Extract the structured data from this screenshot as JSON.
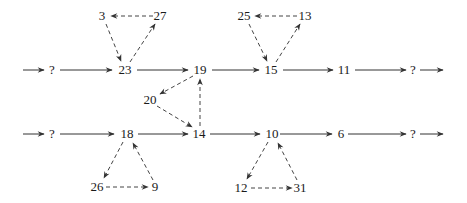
{
  "diagram": {
    "type": "directed-graph",
    "nodes": [
      {
        "id": "q1",
        "label": "?",
        "x": 78,
        "y": 70
      },
      {
        "id": "n23",
        "label": "23",
        "x": 125,
        "y": 70
      },
      {
        "id": "n19",
        "label": "19",
        "x": 200,
        "y": 70
      },
      {
        "id": "n15",
        "label": "15",
        "x": 271,
        "y": 70
      },
      {
        "id": "n11",
        "label": "11",
        "x": 344,
        "y": 70
      },
      {
        "id": "q2",
        "label": "?",
        "x": 413,
        "y": 70
      },
      {
        "id": "n3",
        "label": "3",
        "x": 102,
        "y": 16
      },
      {
        "id": "n27",
        "label": "27",
        "x": 160,
        "y": 16
      },
      {
        "id": "n25",
        "label": "25",
        "x": 244,
        "y": 16
      },
      {
        "id": "n13",
        "label": "13",
        "x": 305,
        "y": 16
      },
      {
        "id": "n20",
        "label": "20",
        "x": 150,
        "y": 101
      },
      {
        "id": "q3",
        "label": "?",
        "x": 78,
        "y": 134
      },
      {
        "id": "n18",
        "label": "18",
        "x": 127,
        "y": 134
      },
      {
        "id": "n14",
        "label": "14",
        "x": 199,
        "y": 134
      },
      {
        "id": "n10",
        "label": "10",
        "x": 272,
        "y": 134
      },
      {
        "id": "n6",
        "label": "6",
        "x": 341,
        "y": 134
      },
      {
        "id": "q4",
        "label": "?",
        "x": 413,
        "y": 134
      },
      {
        "id": "n26",
        "label": "26",
        "x": 97,
        "y": 187
      },
      {
        "id": "n9",
        "label": "9",
        "x": 155,
        "y": 187
      },
      {
        "id": "n12",
        "label": "12",
        "x": 241,
        "y": 188
      },
      {
        "id": "n31",
        "label": "31",
        "x": 300,
        "y": 188
      }
    ],
    "edges_solid": [
      [
        "in1",
        "q1"
      ],
      [
        "q1",
        "n23"
      ],
      [
        "n23",
        "n19"
      ],
      [
        "n19",
        "n15"
      ],
      [
        "n15",
        "n11"
      ],
      [
        "n11",
        "q2"
      ],
      [
        "q2",
        "out1"
      ],
      [
        "in2",
        "q3"
      ],
      [
        "q3",
        "n18"
      ],
      [
        "n18",
        "n14"
      ],
      [
        "n14",
        "n10"
      ],
      [
        "n10",
        "n6"
      ],
      [
        "n6",
        "q4"
      ],
      [
        "q4",
        "out2"
      ]
    ],
    "edges_dashed": [
      [
        "n3",
        "n23"
      ],
      [
        "n23",
        "n27"
      ],
      [
        "n27",
        "n3"
      ],
      [
        "n25",
        "n15"
      ],
      [
        "n15",
        "n13"
      ],
      [
        "n13",
        "n25"
      ],
      [
        "n19",
        "n20"
      ],
      [
        "n20",
        "n14"
      ],
      [
        "n14",
        "n19"
      ],
      [
        "n18",
        "n26"
      ],
      [
        "n26",
        "n9"
      ],
      [
        "n9",
        "n18"
      ],
      [
        "n10",
        "n12"
      ],
      [
        "n12",
        "n31"
      ],
      [
        "n31",
        "n10"
      ]
    ]
  }
}
